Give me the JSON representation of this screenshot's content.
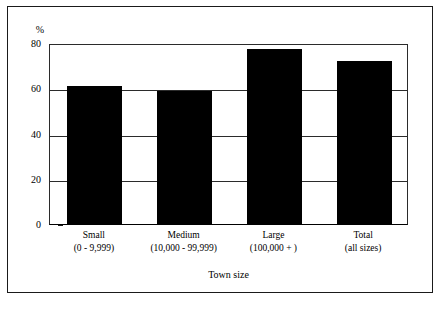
{
  "chart_data": {
    "type": "bar",
    "title": "",
    "subtitle": "",
    "xlabel": "Town size",
    "ylabel": "%",
    "ylim": [
      0,
      80
    ],
    "yticks": [
      0,
      20,
      40,
      60,
      80
    ],
    "ytick_labels": [
      "0",
      "20",
      "40",
      "60",
      "80"
    ],
    "grid": "horizontal",
    "legend": "none",
    "bar_color": "#000000",
    "categories": [
      "Small (0 - 9,999)",
      "Medium (10,000 - 99,999)",
      "Large (100,000 + )",
      "Total (all sizes)"
    ],
    "category_lines": [
      {
        "line1": "Small",
        "line2": "(0 - 9,999)"
      },
      {
        "line1": "Medium",
        "line2": "(10,000 - 99,999)"
      },
      {
        "line1": "Large",
        "line2": "(100,000 + )"
      },
      {
        "line1": "Total",
        "line2": "(all sizes)"
      }
    ],
    "values": [
      61,
      59,
      77.5,
      72
    ]
  },
  "axes": {
    "y_unit_label": "%",
    "x_title": "Town size"
  }
}
